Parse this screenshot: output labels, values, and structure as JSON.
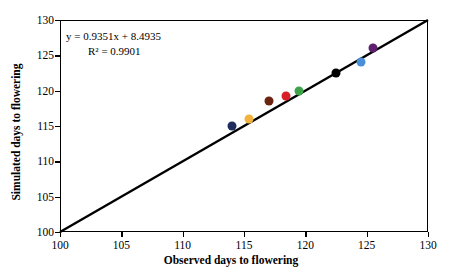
{
  "chart_data": {
    "type": "scatter",
    "title": "",
    "xlabel": "Observed days to flowering",
    "ylabel": "Simulated days to flowering",
    "xlim": [
      100,
      130
    ],
    "ylim": [
      100,
      130
    ],
    "xticks": [
      100,
      105,
      110,
      115,
      120,
      125,
      130
    ],
    "yticks": [
      100,
      105,
      110,
      115,
      120,
      125,
      130
    ],
    "grid": false,
    "legend": "none",
    "annotations": {
      "equation": "y = 0.9351x + 8.4935",
      "r_squared": "R² = 0.9901",
      "slope": 0.9351,
      "intercept": 8.4935,
      "r2": 0.9901
    },
    "reference_line": {
      "name": "1:1 line",
      "x": [
        100,
        130
      ],
      "y": [
        100,
        130
      ],
      "color": "#000000"
    },
    "points": [
      {
        "x": 114.0,
        "y": 115.0,
        "color": "#1f2d5c"
      },
      {
        "x": 115.4,
        "y": 116.0,
        "color": "#f2b33d"
      },
      {
        "x": 117.0,
        "y": 118.5,
        "color": "#6b2410"
      },
      {
        "x": 118.4,
        "y": 119.3,
        "color": "#d81f26"
      },
      {
        "x": 119.5,
        "y": 120.0,
        "color": "#3fa34a"
      },
      {
        "x": 122.5,
        "y": 122.5,
        "color": "#000000"
      },
      {
        "x": 124.5,
        "y": 124.0,
        "color": "#4a90d9"
      },
      {
        "x": 125.5,
        "y": 126.0,
        "color": "#5f1f6e"
      }
    ]
  },
  "axes": {
    "x_title": "Observed days to flowering",
    "y_title": "Simulated days to flowering",
    "x_tick_labels": [
      "100",
      "105",
      "110",
      "115",
      "120",
      "125",
      "130"
    ],
    "y_tick_labels": [
      "100",
      "105",
      "110",
      "115",
      "120",
      "125",
      "130"
    ]
  },
  "equation": {
    "line1": "y = 0.9351x + 8.4935",
    "line2": "R² = 0.9901"
  }
}
